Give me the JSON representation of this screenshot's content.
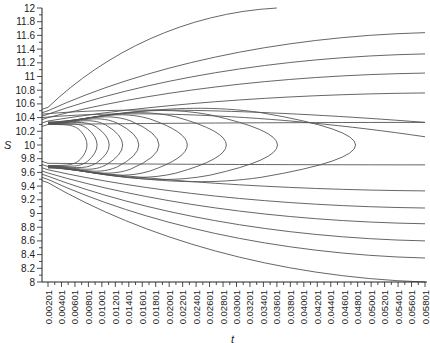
{
  "chart_data": {
    "type": "contour",
    "title": "",
    "xlabel": "t",
    "ylabel": "S",
    "xlim": [
      0.00201,
      0.05801
    ],
    "ylim": [
      8,
      12
    ],
    "grid": false,
    "legend": null,
    "x_tick_labels": [
      "0.00201",
      "0.00401",
      "0.00601",
      "0.00801",
      "0.01001",
      "0.01201",
      "0.01401",
      "0.01601",
      "0.01801",
      "0.02001",
      "0.02201",
      "0.02401",
      "0.02601",
      "0.02801",
      "0.03001",
      "0.03201",
      "0.03401",
      "0.03601",
      "0.03801",
      "0.04001",
      "0.04201",
      "0.04401",
      "0.04601",
      "0.04801",
      "0.05001",
      "0.05201",
      "0.05401",
      "0.05601",
      "0.05801"
    ],
    "y_tick_labels": [
      "8",
      "8.2",
      "8.4",
      "8.6",
      "8.8",
      "9",
      "9.2",
      "9.4",
      "9.6",
      "9.8",
      "10",
      "10.2",
      "10.4",
      "10.6",
      "10.8",
      "11",
      "11.2",
      "11.4",
      "11.6",
      "11.8",
      "12"
    ],
    "y_minor_tick_step": 0.1,
    "upper_open_contours": {
      "origin_S_range": [
        10.25,
        10.55
      ],
      "end_S_at_right_edge": [
        12.0,
        11.64,
        11.33,
        11.05,
        10.76,
        10.33
      ],
      "note": "topmost contour ends at S=12 near t=0.0360"
    },
    "lower_open_contours": {
      "origin_S_range": [
        9.45,
        9.78
      ],
      "end_S_at_right_edge": [
        9.71,
        9.33,
        9.08,
        8.85,
        8.6,
        8.35,
        8.0
      ]
    },
    "closed_loop_contours": {
      "center_S": 10.0,
      "upper_branch_S_near_t0": 10.27,
      "lower_branch_S_near_t0": 9.73,
      "tip_t_values": [
        0.0078,
        0.0093,
        0.0111,
        0.0131,
        0.0155,
        0.0185,
        0.0227,
        0.0285,
        0.0361,
        0.0477
      ]
    }
  },
  "axes": {
    "y_label": "S",
    "x_label": "t"
  }
}
